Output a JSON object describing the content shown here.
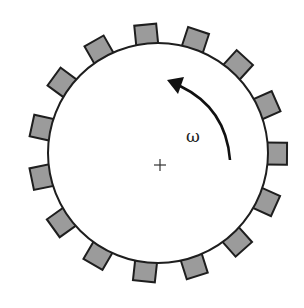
{
  "diagram": {
    "center": {
      "x": 158,
      "y": 153
    },
    "disk_radius": 110,
    "tooth_count": 15,
    "tooth_size": 22,
    "tooth_angles_deg": [
      95.7,
      71.7,
      47.7,
      23.7,
      -0.3,
      -24.3,
      -48.3,
      -72.3,
      -96.3,
      -120.3,
      -144.3,
      -168.3,
      167.7,
      143.7,
      119.7
    ],
    "rotation_label": "ω",
    "rotation_direction": "counterclockwise",
    "center_marker": "+",
    "colors": {
      "tooth_fill": "#9b9b9b",
      "stroke": "#1e1e1e",
      "disk_fill": "#ffffff"
    }
  }
}
